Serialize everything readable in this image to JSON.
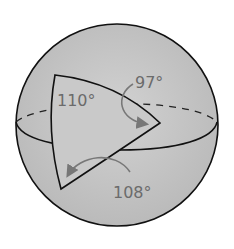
{
  "diagram": {
    "angles": [
      {
        "label": "110°",
        "vertex": "top-left"
      },
      {
        "label": "97°",
        "vertex": "right"
      },
      {
        "label": "108°",
        "vertex": "bottom-left"
      }
    ],
    "colors": {
      "sphere_fill": "#c4c4c4",
      "outline": "#111111",
      "label": "#6b6b6b",
      "background": "#ffffff"
    }
  }
}
